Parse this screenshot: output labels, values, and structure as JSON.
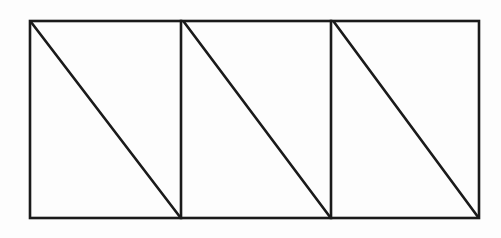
{
  "figure": {
    "title": "",
    "background_color": "#fdfdfd",
    "stroke_color": "#1a1a1a",
    "stroke_width": 2.6,
    "outer_rect": {
      "name": "outer-rectangle",
      "x": 30,
      "y": 21,
      "width": 449,
      "height": 197
    },
    "dividers": [
      {
        "name": "vertical-divider-1",
        "x": 181,
        "y1": 21,
        "y2": 218
      },
      {
        "name": "vertical-divider-2",
        "x": 331,
        "y1": 21,
        "y2": 218
      }
    ],
    "cells": [
      {
        "name": "cell-1",
        "x": 30,
        "width": 151,
        "diagonal": {
          "x1": 31,
          "y1": 22,
          "x2": 180,
          "y2": 217
        }
      },
      {
        "name": "cell-2",
        "x": 181,
        "width": 150,
        "diagonal": {
          "x1": 184,
          "y1": 22,
          "x2": 330,
          "y2": 217
        }
      },
      {
        "name": "cell-3",
        "x": 331,
        "width": 148,
        "diagonal": {
          "x1": 334,
          "y1": 22,
          "x2": 478,
          "y2": 217
        }
      }
    ]
  },
  "chart_data": {
    "type": "diagram",
    "title": "",
    "shape_count": 3,
    "shapes": [
      {
        "label": "rectangle-with-diagonal-1",
        "corners": [
          [
            30,
            21
          ],
          [
            181,
            21
          ],
          [
            181,
            218
          ],
          [
            30,
            218
          ]
        ],
        "diagonal": [
          [
            30,
            21
          ],
          [
            181,
            218
          ]
        ]
      },
      {
        "label": "rectangle-with-diagonal-2",
        "corners": [
          [
            181,
            21
          ],
          [
            331,
            21
          ],
          [
            331,
            218
          ],
          [
            181,
            218
          ]
        ],
        "diagonal": [
          [
            181,
            21
          ],
          [
            331,
            218
          ]
        ]
      },
      {
        "label": "rectangle-with-diagonal-3",
        "corners": [
          [
            331,
            21
          ],
          [
            479,
            21
          ],
          [
            479,
            218
          ],
          [
            331,
            218
          ]
        ],
        "diagonal": [
          [
            331,
            21
          ],
          [
            479,
            218
          ]
        ]
      }
    ],
    "xlabel": "",
    "ylabel": "",
    "legend": []
  }
}
